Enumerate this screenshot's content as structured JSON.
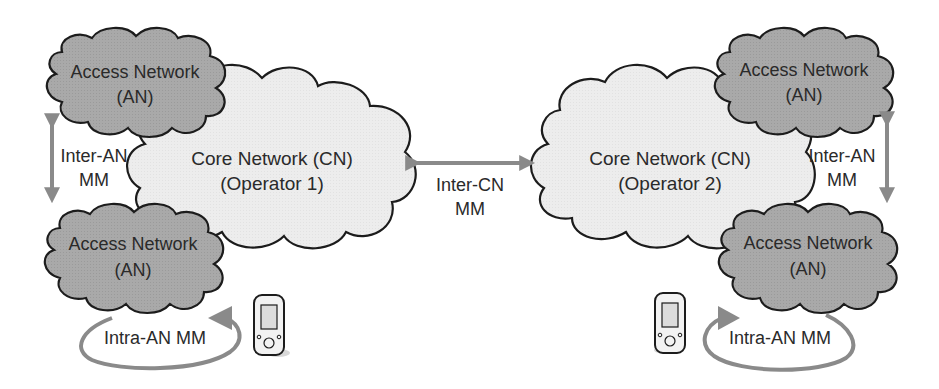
{
  "diagram": {
    "colors": {
      "access_fill": "#a9a9a9",
      "core_fill": "#ececec",
      "stroke": "#1c1c1c",
      "arrow": "#8a8a8a",
      "text": "#2a2a2a"
    },
    "left": {
      "core": {
        "line1": "Core Network (CN)",
        "line2": "(Operator 1)"
      },
      "access_top": {
        "line1": "Access Network",
        "line2": "(AN)"
      },
      "access_bottom": {
        "line1": "Access Network",
        "line2": "(AN)"
      },
      "inter_an": {
        "line1": "Inter-AN",
        "line2": "MM"
      },
      "intra_an": {
        "label": "Intra-AN MM"
      },
      "device": "mobile-phone"
    },
    "center": {
      "inter_cn": {
        "line1": "Inter-CN",
        "line2": "MM"
      }
    },
    "right": {
      "core": {
        "line1": "Core Network (CN)",
        "line2": "(Operator 2)"
      },
      "access_top": {
        "line1": "Access Network",
        "line2": "(AN)"
      },
      "access_bottom": {
        "line1": "Access Network",
        "line2": "(AN)"
      },
      "inter_an": {
        "line1": "Inter-AN",
        "line2": "MM"
      },
      "intra_an": {
        "label": "Intra-AN MM"
      },
      "device": "mobile-phone"
    }
  }
}
